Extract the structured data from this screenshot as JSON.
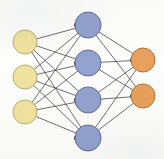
{
  "figure": {
    "type": "node-link-diagram",
    "width": 164,
    "height": 159,
    "background_color": "#fdfdfb",
    "edge_color": "#4a4a52",
    "edge_width": 0.8,
    "node_stroke_color": "#8c8c78",
    "node_stroke_width": 1
  },
  "chart_data": {
    "type": "diagram",
    "layout_hint": "three layers left-to-right, fully connected between adjacent layers",
    "layers": [
      {
        "name": "input-layer",
        "role": "input",
        "count": 3,
        "color": "#f0e3a0",
        "stroke": "#b9ac6e",
        "radius": 12,
        "x": 25,
        "nodes": [
          {
            "id": "i1",
            "cx": 25,
            "cy": 42
          },
          {
            "id": "i2",
            "cx": 25,
            "cy": 77
          },
          {
            "id": "i3",
            "cx": 25,
            "cy": 112
          }
        ]
      },
      {
        "name": "hidden-layer",
        "role": "hidden",
        "count": 4,
        "color": "#93a2ce",
        "stroke": "#5f6c96",
        "radius": 13,
        "x": 88,
        "nodes": [
          {
            "id": "h1",
            "cx": 88,
            "cy": 25
          },
          {
            "id": "h2",
            "cx": 88,
            "cy": 63
          },
          {
            "id": "h3",
            "cx": 88,
            "cy": 100
          },
          {
            "id": "h4",
            "cx": 88,
            "cy": 138
          }
        ]
      },
      {
        "name": "output-layer",
        "role": "output",
        "count": 2,
        "color": "#e8a05c",
        "stroke": "#b1743a",
        "radius": 12,
        "x": 143,
        "nodes": [
          {
            "id": "o1",
            "cx": 143,
            "cy": 60
          },
          {
            "id": "o2",
            "cx": 143,
            "cy": 96
          }
        ]
      }
    ],
    "edges": [
      {
        "from": "i1",
        "to": "h1"
      },
      {
        "from": "i1",
        "to": "h2"
      },
      {
        "from": "i1",
        "to": "h3"
      },
      {
        "from": "i1",
        "to": "h4"
      },
      {
        "from": "i2",
        "to": "h1"
      },
      {
        "from": "i2",
        "to": "h2"
      },
      {
        "from": "i2",
        "to": "h3"
      },
      {
        "from": "i2",
        "to": "h4"
      },
      {
        "from": "i3",
        "to": "h1"
      },
      {
        "from": "i3",
        "to": "h2"
      },
      {
        "from": "i3",
        "to": "h3"
      },
      {
        "from": "i3",
        "to": "h4"
      },
      {
        "from": "h1",
        "to": "o1"
      },
      {
        "from": "h1",
        "to": "o2"
      },
      {
        "from": "h2",
        "to": "o1"
      },
      {
        "from": "h2",
        "to": "o2"
      },
      {
        "from": "h3",
        "to": "o1"
      },
      {
        "from": "h3",
        "to": "o2"
      },
      {
        "from": "h4",
        "to": "o1"
      },
      {
        "from": "h4",
        "to": "o2"
      }
    ],
    "edge_count": 20,
    "node_count": 9,
    "labels": [],
    "legend": []
  }
}
